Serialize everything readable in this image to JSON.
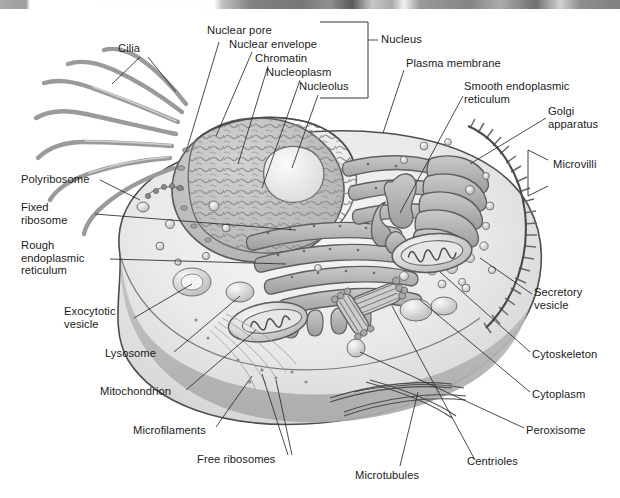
{
  "diagram": {
    "figure_type": "labeled biological cutaway illustration",
    "style": "grayscale pen-and-ink textbook drawing",
    "scan_artifact_top": true
  },
  "labels": {
    "cilia": "Cilia",
    "nuclear_pore": "Nuclear pore",
    "nuclear_envelope": "Nuclear envelope",
    "chromatin": "Chromatin",
    "nucleoplasm": "Nucleoplasm",
    "nucleolus": "Nucleolus",
    "nucleus": "Nucleus",
    "plasma_membrane": "Plasma membrane",
    "smooth_er": "Smooth endoplasmic\nreticulum",
    "golgi": "Golgi\napparatus",
    "microvilli": "Microvilli",
    "polyribosome": "Polyribosome",
    "fixed_ribosome": "Fixed\nribosome",
    "rough_er": "Rough\nendoplasmic\nreticulum",
    "exocytotic_vesicle": "Exocytotic\nvesicle",
    "lysosome": "Lysosome",
    "mitochondrion": "Mitochondrion",
    "microfilaments": "Microfilaments",
    "free_ribosomes": "Free ribosomes",
    "microtubules": "Microtubules",
    "centrioles": "Centrioles",
    "peroxisome": "Peroxisome",
    "cytoplasm": "Cytoplasm",
    "cytoskeleton": "Cytoskeleton",
    "secretory_vesicle": "Secretory\nvesicle"
  },
  "colors": {
    "ink": "#1b1b1b",
    "leader_line": "#2a2a2a",
    "cytosol_light": "#ececec",
    "cytosol_mid": "#d8d8d8",
    "cutaway_floor": "#b4b4b4",
    "nucleus_fill": "#c4c4c4",
    "nucleolus": "#f2f2f2",
    "organelle_gray": "#a9a9a9",
    "membrane_stroke": "#5d5d5d",
    "cilia_gray": "#9b9b9b",
    "background": "#ffffff"
  },
  "structures": [
    {
      "name": "cilia",
      "description": "wavy hair-like projections on upper-left surface"
    },
    {
      "name": "nucleus",
      "description": "large ovoid organelle, cut open, containing chromatin and nucleolus"
    },
    {
      "name": "nucleolus",
      "description": "pale rounded mass inside nucleus"
    },
    {
      "name": "rough-endoplasmic-reticulum",
      "description": "stacked ribosome-studded cisternae right of nucleus"
    },
    {
      "name": "smooth-endoplasmic-reticulum",
      "description": "tubular network left of Golgi"
    },
    {
      "name": "golgi-apparatus",
      "description": "stacked curved cisternae with budding vesicles"
    },
    {
      "name": "microvilli",
      "description": "fine comb-like projections on right membrane edge"
    },
    {
      "name": "mitochondria",
      "description": "bean-shaped organelles with wavy internal cristae"
    },
    {
      "name": "centrioles",
      "description": "paired bundles of microtubule triplets"
    },
    {
      "name": "microtubules",
      "description": "long thin tubular filaments in lower cytoplasm"
    },
    {
      "name": "vesicles",
      "description": "small spheres scattered through cytoplasm"
    },
    {
      "name": "plasma-membrane",
      "description": "dark outer boundary line of the cell"
    }
  ]
}
